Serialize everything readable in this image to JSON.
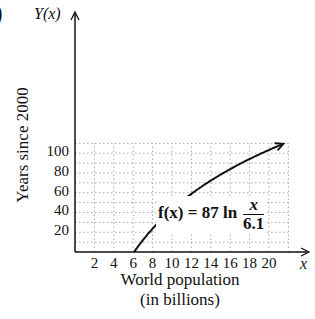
{
  "corner_label": ")",
  "chart_data": {
    "type": "line",
    "title": "",
    "xlabel": "World population (in billions)",
    "xlabel_lines": [
      "World population",
      "(in billions)"
    ],
    "ylabel": "Years since 2000",
    "x_axis_var": "x",
    "y_axis_var": "Y(x)",
    "xlim": [
      0,
      22
    ],
    "ylim": [
      0,
      120
    ],
    "x_ticks": [
      "2",
      "4",
      "6",
      "8",
      "10",
      "12",
      "14",
      "16",
      "18",
      "20"
    ],
    "y_ticks": [
      "20",
      "40",
      "60",
      "80",
      "100"
    ],
    "grid": true,
    "grid_style": "dotted",
    "series": [
      {
        "name": "f(x) = 87 ln (x / 6.1)",
        "formula": "87*ln(x/6.1)",
        "x": [
          6.1,
          7,
          8,
          10,
          12,
          14,
          16,
          18,
          20,
          21.5
        ],
        "values": [
          0,
          12.0,
          23.6,
          43.0,
          58.9,
          72.3,
          83.9,
          94.2,
          103.3,
          109.6
        ]
      }
    ],
    "annotations": [
      {
        "text": "f(x) = 87 ln x/6.1",
        "position": "lower right of curve"
      }
    ]
  },
  "formula": {
    "lhs": "f(x) = 87 ln",
    "numerator": "x",
    "denominator": "6.1"
  }
}
